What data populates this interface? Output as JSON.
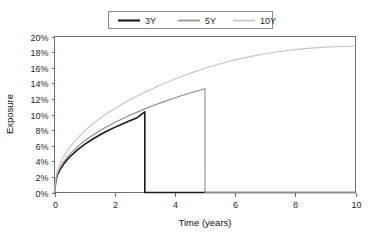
{
  "chart_data": {
    "type": "line",
    "title": "",
    "xlabel": "Time (years)",
    "ylabel": "Exposure",
    "xlim": [
      0,
      10
    ],
    "ylim": [
      0,
      0.2
    ],
    "grid": false,
    "legend_position": "top-center",
    "x_ticks": [
      0,
      2,
      4,
      6,
      8,
      10
    ],
    "x_tick_labels": [
      "0",
      "2",
      "4",
      "6",
      "8",
      "10"
    ],
    "y_ticks": [
      0,
      0.02,
      0.04,
      0.06,
      0.08,
      0.1,
      0.12,
      0.14,
      0.16,
      0.18,
      0.2
    ],
    "y_tick_labels": [
      "0%",
      "2%",
      "4%",
      "6%",
      "8%",
      "10%",
      "12%",
      "14%",
      "16%",
      "18%",
      "20%"
    ],
    "series": [
      {
        "name": "3Y",
        "color": "#1a1a1a",
        "width": 1.6,
        "maturity": 3,
        "peak_value": 0.1035,
        "points": [
          [
            0.0,
            0.0
          ],
          [
            0.05,
            0.0165
          ],
          [
            0.1,
            0.0228
          ],
          [
            0.2,
            0.0305
          ],
          [
            0.3,
            0.0362
          ],
          [
            0.4,
            0.041
          ],
          [
            0.5,
            0.0452
          ],
          [
            0.6,
            0.049
          ],
          [
            0.75,
            0.0542
          ],
          [
            0.9,
            0.0588
          ],
          [
            1.0,
            0.0617
          ],
          [
            1.25,
            0.068
          ],
          [
            1.5,
            0.0737
          ],
          [
            1.75,
            0.0788
          ],
          [
            2.0,
            0.0835
          ],
          [
            2.25,
            0.0879
          ],
          [
            2.5,
            0.092
          ],
          [
            2.75,
            0.0959
          ],
          [
            3.0,
            0.1035
          ],
          [
            3.0,
            0.0
          ],
          [
            10.0,
            0.0
          ]
        ]
      },
      {
        "name": "5Y",
        "color": "#8c8c8c",
        "width": 1.1,
        "maturity": 5,
        "peak_value": 0.133,
        "points": [
          [
            0.0,
            0.0
          ],
          [
            0.05,
            0.0178
          ],
          [
            0.1,
            0.0245
          ],
          [
            0.2,
            0.0327
          ],
          [
            0.3,
            0.0389
          ],
          [
            0.4,
            0.044
          ],
          [
            0.5,
            0.0485
          ],
          [
            0.6,
            0.0526
          ],
          [
            0.75,
            0.0582
          ],
          [
            0.9,
            0.0632
          ],
          [
            1.0,
            0.0663
          ],
          [
            1.25,
            0.0731
          ],
          [
            1.5,
            0.0792
          ],
          [
            1.75,
            0.0847
          ],
          [
            2.0,
            0.0898
          ],
          [
            2.5,
            0.099
          ],
          [
            3.0,
            0.1072
          ],
          [
            3.5,
            0.1146
          ],
          [
            4.0,
            0.1214
          ],
          [
            4.5,
            0.1276
          ],
          [
            5.0,
            0.133
          ],
          [
            5.0,
            0.0
          ],
          [
            10.0,
            0.0
          ]
        ]
      },
      {
        "name": "10Y",
        "color": "#c4c4c4",
        "width": 1.1,
        "maturity": 10,
        "peak_value": 0.1875,
        "points": [
          [
            0.0,
            0.0
          ],
          [
            0.05,
            0.0205
          ],
          [
            0.1,
            0.0285
          ],
          [
            0.2,
            0.0385
          ],
          [
            0.3,
            0.046
          ],
          [
            0.4,
            0.0522
          ],
          [
            0.5,
            0.0576
          ],
          [
            0.6,
            0.0625
          ],
          [
            0.75,
            0.0692
          ],
          [
            0.9,
            0.0752
          ],
          [
            1.0,
            0.079
          ],
          [
            1.25,
            0.0874
          ],
          [
            1.5,
            0.0948
          ],
          [
            1.75,
            0.1015
          ],
          [
            2.0,
            0.1077
          ],
          [
            2.5,
            0.1188
          ],
          [
            3.0,
            0.1286
          ],
          [
            3.5,
            0.1374
          ],
          [
            4.0,
            0.1454
          ],
          [
            4.5,
            0.1527
          ],
          [
            5.0,
            0.1594
          ],
          [
            5.5,
            0.1651
          ],
          [
            6.0,
            0.17
          ],
          [
            6.5,
            0.1742
          ],
          [
            7.0,
            0.1779
          ],
          [
            7.5,
            0.1808
          ],
          [
            8.0,
            0.1832
          ],
          [
            8.5,
            0.1851
          ],
          [
            9.0,
            0.1864
          ],
          [
            9.5,
            0.1872
          ],
          [
            10.0,
            0.1875
          ]
        ]
      }
    ]
  },
  "legend": {
    "entries": [
      {
        "label": "3Y"
      },
      {
        "label": "5Y"
      },
      {
        "label": "10Y"
      }
    ]
  },
  "axes": {
    "x_title": "Time (years)",
    "y_title": "Exposure"
  }
}
